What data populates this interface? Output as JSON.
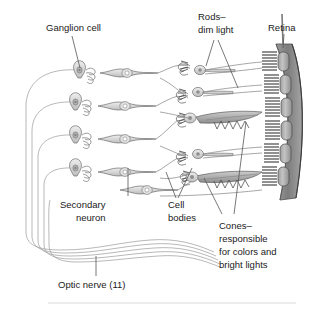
{
  "figure": {
    "labels": [
      {
        "id": "ganglion",
        "text": "Ganglion cell",
        "lines": [
          "Ganglion cell"
        ]
      },
      {
        "id": "rods",
        "text": "Rods–dim light",
        "lines": [
          "Rods–",
          "dim light"
        ]
      },
      {
        "id": "retina",
        "text": "Retina",
        "lines": [
          "Retina"
        ]
      },
      {
        "id": "secondary",
        "text": "Secondary neuron",
        "lines": [
          "Secondary",
          "neuron"
        ]
      },
      {
        "id": "cellbodies",
        "text": "Cell bodies",
        "lines": [
          "Cell",
          "bodies"
        ]
      },
      {
        "id": "cones",
        "text": "Cones–responsible for colors and bright lights",
        "lines": [
          "Cones–",
          "responsible",
          "for colors and",
          "bright lights"
        ]
      },
      {
        "id": "opticnerve",
        "text": "Optic nerve (11)",
        "lines": [
          "Optic nerve (11)"
        ]
      }
    ],
    "label_text": {
      "ganglion_cell": "Ganglion cell",
      "rods_1": "Rods–",
      "rods_2": "dim light",
      "retina": "Retina",
      "secondary_1": "Secondary",
      "secondary_2": "neuron",
      "cell_1": "Cell",
      "cell_2": "bodies",
      "cones_1": "Cones–",
      "cones_2": "responsible",
      "cones_3": "for colors and",
      "cones_4": "bright lights",
      "optic_nerve": "Optic nerve (11)"
    },
    "colors": {
      "background": "#ffffff",
      "text": "#1a1a1a",
      "leader": "#555555",
      "outline": "#6e6e6e",
      "cell_fill": "#d9d9d9",
      "cone_fill": "#b5b5b5",
      "retina_band": "#8f8f8f",
      "retina_segment": "#a8a8a8",
      "bristle": "#2b2b2b",
      "nerve": "#999999",
      "rule": "#cfcfcf"
    },
    "structure": {
      "ganglion_cell_count": 4,
      "secondary_neuron_count": 4,
      "retina_segment_count": 6,
      "optic_nerve_fiber_count": 5,
      "cone_count": 2
    }
  }
}
